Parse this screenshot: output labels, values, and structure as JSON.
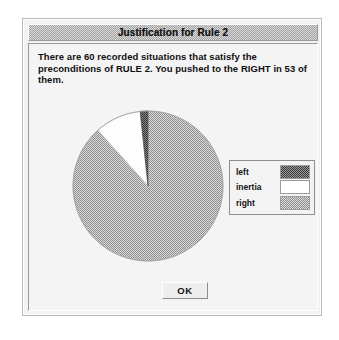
{
  "window": {
    "title": "Justification for Rule 2"
  },
  "message": {
    "lines": [
      "There are 60 recorded situations that satisfy the",
      "preconditions of RULE 2.  You pushed to the RIGHT in 53 of",
      "them."
    ],
    "total_situations": 60,
    "rule_number": 2,
    "chosen_action": "RIGHT",
    "chosen_count": 53
  },
  "legend": {
    "rows": [
      {
        "label": "left",
        "swatch": "dark-dither",
        "color": "#5a5a5a"
      },
      {
        "label": "inertia",
        "swatch": "white",
        "color": "#ffffff"
      },
      {
        "label": "right",
        "swatch": "light-dither",
        "color": "#b4b4b4"
      }
    ]
  },
  "buttons": {
    "ok_label": "OK"
  },
  "chart_data": {
    "type": "pie",
    "title": "",
    "categories": [
      "right",
      "inertia",
      "left"
    ],
    "values": [
      53,
      6,
      1
    ],
    "total": 60,
    "percentages": [
      88.3,
      10.0,
      1.7
    ],
    "colors": [
      "#b4b4b4",
      "#ffffff",
      "#5a5a5a"
    ],
    "legend_position": "right",
    "start_angle_deg": -90,
    "direction": "clockwise",
    "grid": false
  }
}
